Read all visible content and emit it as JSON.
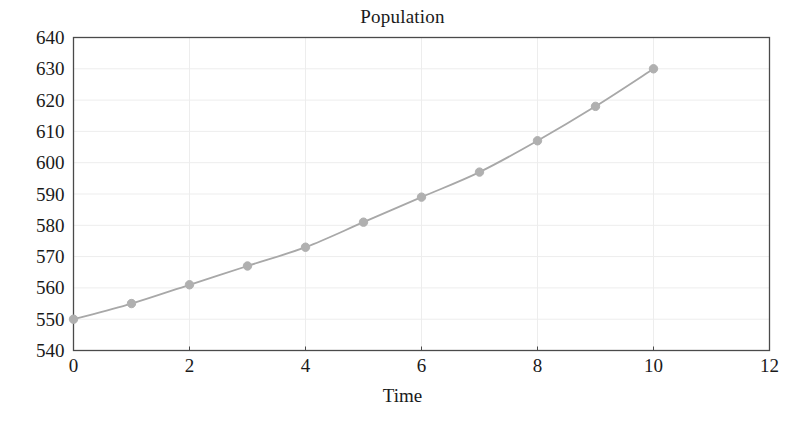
{
  "chart_data": {
    "type": "line",
    "title": "Population",
    "xlabel": "Time",
    "ylabel": "",
    "x": [
      0,
      1,
      2,
      3,
      4,
      5,
      6,
      7,
      8,
      9,
      10
    ],
    "values": [
      550,
      555,
      561,
      567,
      573,
      581,
      589,
      597,
      607,
      618,
      630
    ],
    "series": [
      {
        "name": "Population",
        "x": [
          0,
          1,
          2,
          3,
          4,
          5,
          6,
          7,
          8,
          9,
          10
        ],
        "values": [
          550,
          555,
          561,
          567,
          573,
          581,
          589,
          597,
          607,
          618,
          630
        ]
      }
    ],
    "xlim": [
      0,
      12
    ],
    "ylim": [
      540,
      640
    ],
    "xticks": [
      0,
      2,
      4,
      6,
      8,
      10,
      12
    ],
    "yticks": [
      540,
      550,
      560,
      570,
      580,
      590,
      600,
      610,
      620,
      630,
      640
    ],
    "xtick_labels": [
      "0",
      "2",
      "4",
      "6",
      "8",
      "10",
      "12"
    ],
    "ytick_labels": [
      "540",
      "550",
      "560",
      "570",
      "580",
      "590",
      "600",
      "610",
      "620",
      "630",
      "640"
    ],
    "grid": true,
    "legend": false,
    "legend_position": "none",
    "marker": "circle",
    "line_color": "#a8a8a8",
    "marker_color": "#b0b0b0",
    "grid_color": "#ededed",
    "axis_color": "#4a4a4a",
    "background_color": "#ffffff"
  }
}
